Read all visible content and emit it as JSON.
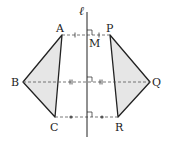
{
  "diagram": {
    "type": "reflection across a line",
    "axis_label": "ℓ",
    "midpoint_label": "M",
    "left_triangle": {
      "vertices": [
        {
          "label": "A",
          "x": 62,
          "y": 35
        },
        {
          "label": "B",
          "x": 23,
          "y": 82
        },
        {
          "label": "C",
          "x": 55,
          "y": 117
        }
      ]
    },
    "right_triangle": {
      "vertices": [
        {
          "label": "P",
          "x": 110,
          "y": 35
        },
        {
          "label": "Q",
          "x": 150,
          "y": 82
        },
        {
          "label": "R",
          "x": 118,
          "y": 117
        }
      ]
    },
    "axis": {
      "x": 87,
      "y1": 12,
      "y2": 137
    },
    "colors": {
      "fill": "#e6e6e6",
      "stroke": "#222222",
      "dashed": "#555555"
    },
    "labels": {
      "A": "A",
      "B": "B",
      "C": "C",
      "P": "P",
      "Q": "Q",
      "R": "R",
      "M": "M",
      "ell": "ℓ"
    }
  }
}
